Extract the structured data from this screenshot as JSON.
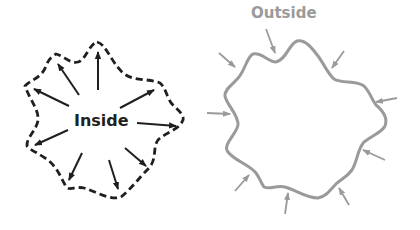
{
  "diagram": {
    "left_shape": {
      "label": "Inside",
      "border_style": "dashed",
      "arrow_direction": "outward",
      "arrow_count": 10,
      "color": "#1f1f1f"
    },
    "right_shape": {
      "label": "Outside",
      "border_style": "solid",
      "arrow_direction": "inward",
      "arrow_count": 11,
      "color": "#9a9a9a"
    }
  }
}
